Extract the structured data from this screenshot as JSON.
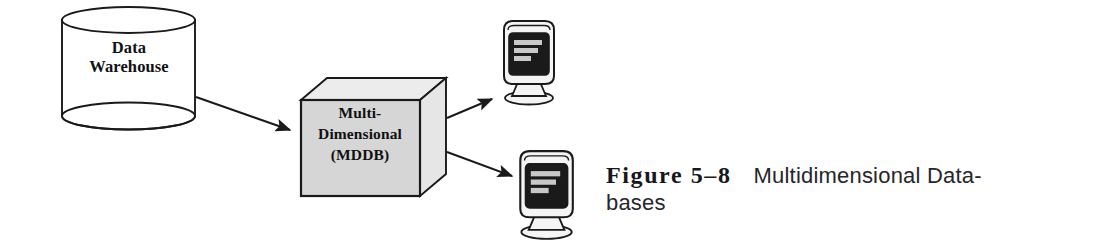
{
  "figure": {
    "caption_number": "Figure 5–8",
    "caption_text_line1": "Multidimensional Data-",
    "caption_text_line2": "bases",
    "caption_full": "Figure 5–8   Multidimensional Databases"
  },
  "nodes": {
    "warehouse": {
      "label": "Data\nWarehouse",
      "shape": "cylinder",
      "icon": "database-cylinder-icon"
    },
    "mddb": {
      "label": "Multi-\nDimensional\n(MDDB)",
      "shape": "cube",
      "icon": "cube-icon"
    },
    "client_top": {
      "label": "",
      "shape": "monitor",
      "icon": "computer-monitor-icon"
    },
    "client_bottom": {
      "label": "",
      "shape": "monitor",
      "icon": "computer-monitor-icon"
    }
  },
  "arrows": [
    {
      "name": "warehouse-to-mddb",
      "from": "warehouse",
      "to": "mddb"
    },
    {
      "name": "mddb-to-client-top",
      "from": "mddb",
      "to": "client_top"
    },
    {
      "name": "mddb-to-client-bottom",
      "from": "mddb",
      "to": "client_bottom"
    }
  ],
  "colors": {
    "background": "#ffffff",
    "stroke": "#1a1a1a",
    "cube_front": "#d6d6d6",
    "cube_top": "#ececec",
    "cube_side": "#e6e6e6",
    "monitor_screen": "#1a1a1a",
    "monitor_body": "#f2f2f2",
    "screen_bar": "#c8c8c8",
    "text": "#111111"
  }
}
